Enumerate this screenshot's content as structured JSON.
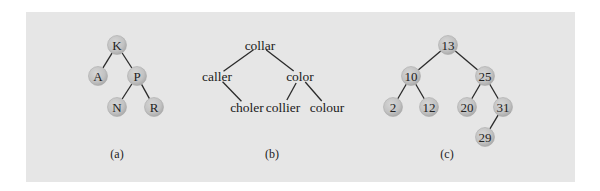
{
  "figure": {
    "colors": {
      "panel_background": "#e6e6e6",
      "node_fill": "#c4c4c4",
      "edge": "#2a2a2a",
      "text": "#222222"
    },
    "panels": [
      {
        "id": "a",
        "caption": "(a)",
        "style": "circles",
        "nodes": [
          {
            "id": "K",
            "label": "K",
            "x": 117,
            "y": 45
          },
          {
            "id": "A",
            "label": "A",
            "x": 98,
            "y": 76
          },
          {
            "id": "P",
            "label": "P",
            "x": 137,
            "y": 76
          },
          {
            "id": "N",
            "label": "N",
            "x": 117,
            "y": 107
          },
          {
            "id": "R",
            "label": "R",
            "x": 154,
            "y": 107
          }
        ],
        "edges": [
          [
            "K",
            "A"
          ],
          [
            "K",
            "P"
          ],
          [
            "P",
            "N"
          ],
          [
            "P",
            "R"
          ]
        ],
        "caption_pos": {
          "x": 117,
          "y": 154
        }
      },
      {
        "id": "b",
        "caption": "(b)",
        "style": "words",
        "nodes": [
          {
            "id": "collar",
            "label": "collar",
            "x": 260,
            "y": 45
          },
          {
            "id": "caller",
            "label": "caller",
            "x": 217,
            "y": 76
          },
          {
            "id": "color",
            "label": "color",
            "x": 300,
            "y": 76
          },
          {
            "id": "choler",
            "label": "choler",
            "x": 247,
            "y": 107
          },
          {
            "id": "collier",
            "label": "collier",
            "x": 283,
            "y": 107
          },
          {
            "id": "colour",
            "label": "colour",
            "x": 327,
            "y": 107
          }
        ],
        "edges": [
          [
            "collar",
            "caller"
          ],
          [
            "collar",
            "color"
          ],
          [
            "caller",
            "choler"
          ],
          [
            "color",
            "collier"
          ],
          [
            "color",
            "colour"
          ]
        ],
        "caption_pos": {
          "x": 272,
          "y": 154
        }
      },
      {
        "id": "c",
        "caption": "(c)",
        "style": "circles",
        "nodes": [
          {
            "id": "n13",
            "label": "13",
            "x": 448,
            "y": 45
          },
          {
            "id": "n10",
            "label": "10",
            "x": 411,
            "y": 76
          },
          {
            "id": "n25",
            "label": "25",
            "x": 485,
            "y": 76
          },
          {
            "id": "n2",
            "label": "2",
            "x": 393,
            "y": 107
          },
          {
            "id": "n12",
            "label": "12",
            "x": 429,
            "y": 107
          },
          {
            "id": "n20",
            "label": "20",
            "x": 467,
            "y": 107
          },
          {
            "id": "n31",
            "label": "31",
            "x": 503,
            "y": 107
          },
          {
            "id": "n29",
            "label": "29",
            "x": 485,
            "y": 137
          }
        ],
        "edges": [
          [
            "n13",
            "n10"
          ],
          [
            "n13",
            "n25"
          ],
          [
            "n10",
            "n2"
          ],
          [
            "n10",
            "n12"
          ],
          [
            "n25",
            "n20"
          ],
          [
            "n25",
            "n31"
          ],
          [
            "n31",
            "n29"
          ]
        ],
        "caption_pos": {
          "x": 447,
          "y": 154
        }
      }
    ]
  }
}
